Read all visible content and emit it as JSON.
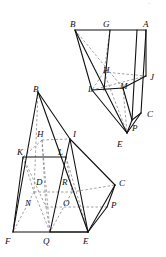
{
  "figure": {
    "background_color": "#ffffff",
    "stroke_color": "#111111",
    "dashed_color": "#7a7a7a",
    "label_color": "#0d0d0d"
  },
  "upper_figure": {
    "name": "upper-solid",
    "labels": [
      {
        "text": "B",
        "x": 70,
        "y": 20
      },
      {
        "text": "G",
        "x": 103,
        "y": 20
      },
      {
        "text": "A",
        "x": 143,
        "y": 20
      },
      {
        "text": "H",
        "x": 103,
        "y": 66
      },
      {
        "text": "J",
        "x": 150,
        "y": 73
      },
      {
        "text": "L",
        "x": 88,
        "y": 85
      },
      {
        "text": "M",
        "x": 120,
        "y": 82
      },
      {
        "text": "C",
        "x": 147,
        "y": 110
      },
      {
        "text": "P",
        "x": 132,
        "y": 124
      },
      {
        "text": "E",
        "x": 117,
        "y": 140
      }
    ],
    "solid_edges": [
      [
        75,
        30,
        146,
        30
      ],
      [
        75,
        30,
        92,
        90
      ],
      [
        92,
        90,
        123,
        88
      ],
      [
        146,
        30,
        141,
        113
      ],
      [
        110,
        30,
        104,
        90
      ],
      [
        141,
        113,
        132,
        120
      ],
      [
        92,
        90,
        127,
        133
      ],
      [
        127,
        133,
        141,
        113
      ],
      [
        127,
        133,
        132,
        120
      ],
      [
        132,
        120,
        123,
        88
      ],
      [
        123,
        88,
        146,
        76
      ],
      [
        146,
        76,
        146,
        30
      ],
      [
        137,
        30,
        132,
        120
      ],
      [
        75,
        30,
        127,
        133
      ]
    ],
    "dashed_edges": [
      [
        75,
        30,
        123,
        88
      ],
      [
        110,
        30,
        104,
        72
      ],
      [
        104,
        72,
        146,
        76
      ],
      [
        92,
        90,
        146,
        76
      ],
      [
        104,
        72,
        92,
        90
      ],
      [
        104,
        72,
        127,
        133
      ],
      [
        123,
        88,
        127,
        133
      ]
    ]
  },
  "lower_figure": {
    "name": "lower-solid",
    "labels": [
      {
        "text": "B",
        "x": 33,
        "y": 85
      },
      {
        "text": "H",
        "x": 37,
        "y": 130
      },
      {
        "text": "I",
        "x": 73,
        "y": 130
      },
      {
        "text": "K",
        "x": 17,
        "y": 148
      },
      {
        "text": "L",
        "x": 58,
        "y": 148
      },
      {
        "text": "D",
        "x": 36,
        "y": 178
      },
      {
        "text": "R",
        "x": 62,
        "y": 178
      },
      {
        "text": "C",
        "x": 119,
        "y": 179
      },
      {
        "text": "N",
        "x": 25,
        "y": 199
      },
      {
        "text": "O",
        "x": 63,
        "y": 199
      },
      {
        "text": "P",
        "x": 111,
        "y": 201
      },
      {
        "text": "F",
        "x": 5,
        "y": 237
      },
      {
        "text": "Q",
        "x": 43,
        "y": 237
      },
      {
        "text": "E",
        "x": 83,
        "y": 237
      }
    ],
    "solid_edges": [
      [
        38,
        92,
        13,
        232
      ],
      [
        38,
        92,
        70,
        139
      ],
      [
        38,
        92,
        88,
        232
      ],
      [
        70,
        139,
        88,
        232
      ],
      [
        13,
        232,
        88,
        232
      ],
      [
        23,
        157,
        66,
        157
      ],
      [
        23,
        157,
        13,
        232
      ],
      [
        66,
        157,
        70,
        139
      ],
      [
        88,
        232,
        115,
        185
      ],
      [
        115,
        185,
        70,
        139
      ],
      [
        50,
        232,
        66,
        157
      ],
      [
        50,
        232,
        88,
        232
      ],
      [
        88,
        232,
        107,
        207
      ],
      [
        107,
        207,
        115,
        185
      ]
    ],
    "dashed_edges": [
      [
        38,
        92,
        34,
        192
      ],
      [
        34,
        192,
        13,
        232
      ],
      [
        34,
        192,
        72,
        192
      ],
      [
        72,
        192,
        115,
        185
      ],
      [
        42,
        140,
        70,
        139
      ],
      [
        42,
        140,
        23,
        157
      ],
      [
        42,
        140,
        46,
        207
      ],
      [
        46,
        207,
        107,
        207
      ],
      [
        23,
        157,
        46,
        207
      ],
      [
        66,
        157,
        72,
        192
      ],
      [
        42,
        140,
        50,
        232
      ],
      [
        46,
        207,
        50,
        232
      ],
      [
        72,
        192,
        50,
        232
      ],
      [
        23,
        157,
        34,
        192
      ],
      [
        66,
        157,
        88,
        232
      ],
      [
        34,
        192,
        50,
        232
      ]
    ]
  },
  "artifact": {
    "mark": "·",
    "x": 148,
    "y": 1
  }
}
